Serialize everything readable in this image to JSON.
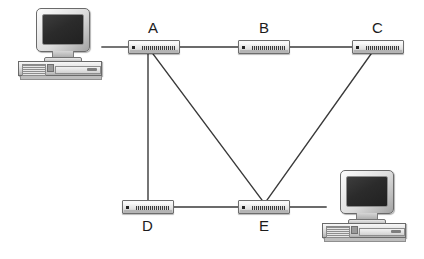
{
  "diagram": {
    "background_color": "#ffffff",
    "line_color": "#3a3a3a",
    "width": 424,
    "height": 259
  },
  "nodes": [
    {
      "id": "A",
      "label": "A",
      "type": "switch",
      "x": 128,
      "y": 40,
      "label_x": 148,
      "label_y": 20
    },
    {
      "id": "B",
      "label": "B",
      "type": "switch",
      "x": 238,
      "y": 40,
      "label_x": 259,
      "label_y": 20
    },
    {
      "id": "C",
      "label": "C",
      "type": "switch",
      "x": 352,
      "y": 40,
      "label_x": 372,
      "label_y": 20
    },
    {
      "id": "D",
      "label": "D",
      "type": "switch",
      "x": 122,
      "y": 200,
      "label_x": 142,
      "label_y": 218
    },
    {
      "id": "E",
      "label": "E",
      "type": "switch",
      "x": 238,
      "y": 200,
      "label_x": 259,
      "label_y": 218
    }
  ],
  "computers": [
    {
      "id": "PC1",
      "position": "top-left",
      "x": 18,
      "y": 8
    },
    {
      "id": "PC2",
      "position": "bottom-right",
      "x": 322,
      "y": 170
    }
  ],
  "links": [
    {
      "from": "PC1",
      "to": "A",
      "x1": 102,
      "y1": 47,
      "x2": 128,
      "y2": 47
    },
    {
      "from": "A",
      "to": "B",
      "x1": 180,
      "y1": 47,
      "x2": 238,
      "y2": 47
    },
    {
      "from": "B",
      "to": "C",
      "x1": 290,
      "y1": 47,
      "x2": 352,
      "y2": 47
    },
    {
      "from": "A",
      "to": "D",
      "x1": 148,
      "y1": 54,
      "x2": 148,
      "y2": 200
    },
    {
      "from": "A",
      "to": "E",
      "x1": 153,
      "y1": 54,
      "x2": 262,
      "y2": 200
    },
    {
      "from": "C",
      "to": "E",
      "x1": 371,
      "y1": 54,
      "x2": 267,
      "y2": 200
    },
    {
      "from": "D",
      "to": "E",
      "x1": 174,
      "y1": 207,
      "x2": 238,
      "y2": 207
    },
    {
      "from": "E",
      "to": "PC2",
      "x1": 290,
      "y1": 207,
      "x2": 326,
      "y2": 207
    }
  ]
}
